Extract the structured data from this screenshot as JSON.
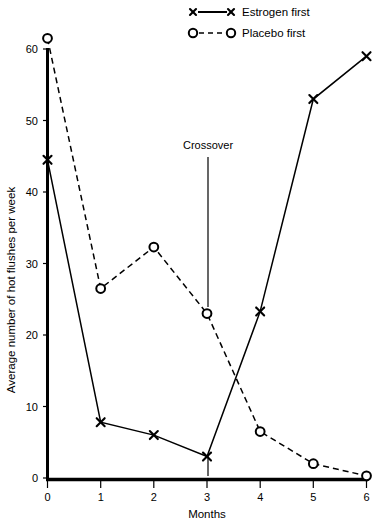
{
  "chart_data": {
    "type": "line",
    "title": "",
    "xlabel": "Months",
    "ylabel": "Average number of hot flushes per week",
    "x": [
      0,
      1,
      2,
      3,
      4,
      5,
      6
    ],
    "xticklabels": [
      "0",
      "1",
      "2",
      "3",
      "4",
      "5",
      "6"
    ],
    "yticks": [
      0,
      10,
      20,
      30,
      40,
      50,
      60
    ],
    "yticklabels": [
      "0",
      "10",
      "20",
      "30",
      "40",
      "50",
      "60"
    ],
    "xlim": [
      0,
      6
    ],
    "ylim": [
      0,
      60
    ],
    "grid": false,
    "legend_position": "top-center",
    "series": [
      {
        "name": "Estrogen first",
        "marker": "x",
        "linestyle": "solid",
        "values": [
          44.5,
          7.8,
          6.0,
          3.0,
          23.3,
          53.0,
          59.0
        ]
      },
      {
        "name": "Placebo first",
        "marker": "o",
        "linestyle": "dashed",
        "values": [
          61.5,
          26.5,
          32.3,
          23.0,
          6.5,
          2.0,
          0.3
        ]
      }
    ],
    "annotations": [
      {
        "label": "Crossover",
        "x": 3,
        "y": 23.0,
        "label_y": 38.5
      }
    ],
    "colors": {
      "axis": "#000000",
      "series_estrogen": "#000000",
      "series_placebo": "#000000",
      "background": "#ffffff"
    }
  }
}
